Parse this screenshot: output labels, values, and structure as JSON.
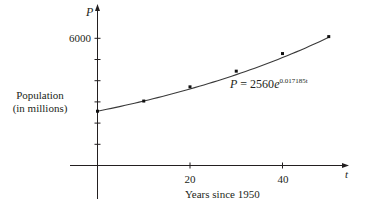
{
  "chart_data": {
    "type": "scatter",
    "title": "",
    "xlabel": "Years since 1950",
    "ylabel": "Population\n(in millions)",
    "x_axis_symbol": "t",
    "y_axis_symbol": "P",
    "x_tick_labels": [
      "20",
      "40"
    ],
    "x_ticks": [
      0,
      10,
      20,
      30,
      40,
      50
    ],
    "y_tick_labels": [
      "6000"
    ],
    "y_ticks": [
      1000,
      2000,
      3000,
      4000,
      5000,
      6000
    ],
    "xlim": [
      -6,
      54
    ],
    "ylim": [
      -1600,
      7500
    ],
    "grid": false,
    "legend": "none",
    "series": [
      {
        "name": "Population data",
        "kind": "scatter",
        "x": [
          0,
          10,
          20,
          30,
          40,
          50
        ],
        "y": [
          2560,
          3040,
          3710,
          4450,
          5280,
          6080
        ]
      },
      {
        "name": "Exponential model",
        "kind": "line",
        "formula": "P = 2560e^(0.017185t)",
        "a": 2560,
        "k": 0.017185,
        "x_range": [
          0,
          50
        ]
      }
    ],
    "annotations": [
      {
        "text": "P = 2560e",
        "superscript": "0.017185t",
        "x": 30,
        "y": 3600
      }
    ]
  },
  "labels": {
    "y_symbol": "P",
    "x_symbol": "t",
    "y_tick_6000": "6000",
    "x_tick_20": "20",
    "x_tick_40": "40",
    "ylabel_line1": "Population",
    "ylabel_line2": "(in millions)",
    "xlabel": "Years since 1950",
    "equation_main": "P = 2560",
    "equation_e": "e",
    "equation_exp": "0.017185t"
  }
}
